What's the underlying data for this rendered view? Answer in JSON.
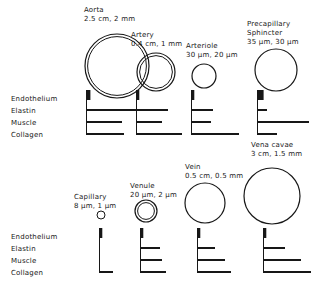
{
  "figure": {
    "background_color": "#ffffff",
    "ink_color": "#171717"
  },
  "layer_legend": {
    "top": {
      "items": [
        {
          "key": "endothelium",
          "label": "Endothelium"
        },
        {
          "key": "elastin",
          "label": "Elastin"
        },
        {
          "key": "muscle",
          "label": "Muscle"
        },
        {
          "key": "collagen",
          "label": "Collagen"
        }
      ]
    },
    "bottom": {
      "items": [
        {
          "key": "endothelium",
          "label": "Endothelium"
        },
        {
          "key": "elastin",
          "label": "Elastin"
        },
        {
          "key": "muscle",
          "label": "Muscle"
        },
        {
          "key": "collagen",
          "label": "Collagen"
        }
      ]
    }
  },
  "vessels": [
    {
      "id": "aorta",
      "name": "Aorta",
      "dimensions": "2.5 cm, 2 mm",
      "diameter_text": "2.5 cm",
      "wall_text": "2 mm",
      "row": "top",
      "label_align": "left",
      "lumen_cx": 117,
      "lumen_cy": 66,
      "lumen_r": 32,
      "lumen_double": true,
      "label_x": 84,
      "label_y": 6,
      "bar_x": 86,
      "bars": {
        "endothelium": 8,
        "elastin": 62,
        "muscle": 36,
        "collagen": 38
      }
    },
    {
      "id": "artery",
      "name": "Artery",
      "dimensions": "0.4 cm, 1 mm",
      "diameter_text": "0.4 cm",
      "wall_text": "1 mm",
      "row": "top",
      "label_align": "left",
      "lumen_cx": 156,
      "lumen_cy": 72,
      "lumen_r": 19,
      "lumen_double": true,
      "label_x": 131,
      "label_y": 31,
      "bar_x": 136,
      "bars": {
        "endothelium": 6,
        "elastin": 32,
        "muscle": 26,
        "collagen": 46
      }
    },
    {
      "id": "arteriole",
      "name": "Arteriole",
      "dimensions": "30 μm, 20 μm",
      "diameter_text": "30 μm",
      "wall_text": "20 μm",
      "row": "top",
      "label_align": "left",
      "lumen_cx": 204,
      "lumen_cy": 76,
      "lumen_r": 12,
      "lumen_double": false,
      "label_x": 186,
      "label_y": 42,
      "bar_x": 191,
      "bars": {
        "endothelium": 6,
        "elastin": 22,
        "muscle": 20,
        "collagen": 48
      }
    },
    {
      "id": "precapillary-sphincter",
      "name": "Precapillary Sphincter",
      "name_line1": "Precapillary",
      "name_line2": "Sphincter",
      "dimensions": "35 μm, 30 μm",
      "diameter_text": "35 μm",
      "wall_text": "30 μm",
      "row": "top",
      "label_align": "left",
      "lumen_cx": 276,
      "lumen_cy": 70,
      "lumen_r": 21,
      "lumen_double": false,
      "label_x": 247,
      "label_y": 20,
      "bar_x": 257,
      "bars": {
        "endothelium": 12,
        "elastin": 10,
        "muscle": 52,
        "collagen": 20
      }
    },
    {
      "id": "capillary",
      "name": "Capillary",
      "dimensions": "8 μm, 1 μm",
      "diameter_text": "8 μm",
      "wall_text": "1 μm",
      "row": "bottom",
      "label_align": "left",
      "lumen_cx": 101,
      "lumen_cy": 215,
      "lumen_r": 4,
      "lumen_double": false,
      "label_x": 74,
      "label_y": 193,
      "bar_x": 99,
      "bars": {
        "endothelium": 6,
        "elastin": 0,
        "muscle": 0,
        "collagen": 14
      }
    },
    {
      "id": "venule",
      "name": "Venule",
      "dimensions": "20 μm, 2 μm",
      "diameter_text": "20 μm",
      "wall_text": "2 μm",
      "row": "bottom",
      "label_align": "left",
      "lumen_cx": 146,
      "lumen_cy": 211,
      "lumen_r": 11,
      "lumen_double": true,
      "label_x": 130,
      "label_y": 182,
      "bar_x": 140,
      "bars": {
        "endothelium": 6,
        "elastin": 20,
        "muscle": 22,
        "collagen": 26
      }
    },
    {
      "id": "vein",
      "name": "Vein",
      "dimensions": "0.5 cm, 0.5 mm",
      "diameter_text": "0.5 cm",
      "wall_text": "0.5 mm",
      "row": "bottom",
      "label_align": "left",
      "lumen_cx": 205,
      "lumen_cy": 203,
      "lumen_r": 20,
      "lumen_double": false,
      "label_x": 185,
      "label_y": 163,
      "bar_x": 197,
      "bars": {
        "endothelium": 6,
        "elastin": 18,
        "muscle": 28,
        "collagen": 34
      }
    },
    {
      "id": "vena-cavae",
      "name": "Vena cavae",
      "dimensions": "3 cm, 1.5 mm",
      "diameter_text": "3 cm",
      "wall_text": "1.5 mm",
      "row": "bottom",
      "label_align": "left",
      "lumen_cx": 272,
      "lumen_cy": 196,
      "lumen_r": 28,
      "lumen_double": false,
      "label_x": 251,
      "label_y": 141,
      "bar_x": 263,
      "bars": {
        "endothelium": 6,
        "elastin": 22,
        "muscle": 38,
        "collagen": 48
      }
    }
  ],
  "chart_data": {
    "type": "bar",
    "xlabel": "",
    "ylabel": "",
    "categories": [
      "Endothelium",
      "Elastin",
      "Muscle",
      "Collagen"
    ],
    "series": [
      {
        "name": "Aorta",
        "diameter": "2.5 cm",
        "wall": "2 mm",
        "values": [
          8,
          62,
          36,
          38
        ]
      },
      {
        "name": "Artery",
        "diameter": "0.4 cm",
        "wall": "1 mm",
        "values": [
          6,
          32,
          26,
          46
        ]
      },
      {
        "name": "Arteriole",
        "diameter": "30 μm",
        "wall": "20 μm",
        "values": [
          6,
          22,
          20,
          48
        ]
      },
      {
        "name": "Precapillary Sphincter",
        "diameter": "35 μm",
        "wall": "30 μm",
        "values": [
          12,
          10,
          52,
          20
        ]
      },
      {
        "name": "Capillary",
        "diameter": "8 μm",
        "wall": "1 μm",
        "values": [
          6,
          0,
          0,
          14
        ]
      },
      {
        "name": "Venule",
        "diameter": "20 μm",
        "wall": "2 μm",
        "values": [
          6,
          20,
          22,
          26
        ]
      },
      {
        "name": "Vein",
        "diameter": "0.5 cm",
        "wall": "0.5 mm",
        "values": [
          6,
          18,
          28,
          34
        ]
      },
      {
        "name": "Vena cavae",
        "diameter": "3 cm",
        "wall": "1.5 mm",
        "values": [
          6,
          22,
          38,
          48
        ]
      }
    ],
    "grid": false,
    "legend_position": "left"
  }
}
